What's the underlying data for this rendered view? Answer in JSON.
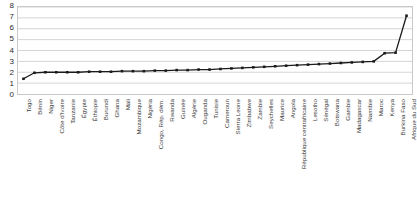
{
  "chart_data": {
    "type": "line",
    "title": "",
    "xlabel": "",
    "ylabel": "",
    "ylim": [
      0,
      8
    ],
    "yticks": [
      0,
      1,
      2,
      3,
      4,
      5,
      6,
      7,
      8
    ],
    "grid": true,
    "legend": false,
    "marker": "square",
    "line_color": "#1a1a1a",
    "grid_color": "#c9c9c9",
    "categories": [
      "Togo",
      "Bénin",
      "Niger",
      "Côte d'Ivoire",
      "Tanzanie",
      "Égypte",
      "Éthiopie",
      "Burundi",
      "Ghana",
      "Mali",
      "Mozambique",
      "Nigéria",
      "Congo, Rép. dém.",
      "Rwanda",
      "Guinée",
      "Algérie",
      "Ouganda",
      "Tunisie",
      "Cameroun",
      "Sierra Leone",
      "Zimbabwe",
      "Zambie",
      "Seychelles",
      "Maurice",
      "Angola",
      "République centrafricaine",
      "Lesotho",
      "Sénégal",
      "Botswana",
      "Gambie",
      "Madagascar",
      "Namibie",
      "Maroc",
      "Kenya",
      "Burkina Faso",
      "Afrique du Sud"
    ],
    "values": [
      1.4,
      1.95,
      2.0,
      2.0,
      2.0,
      2.0,
      2.05,
      2.05,
      2.05,
      2.1,
      2.1,
      2.1,
      2.15,
      2.15,
      2.2,
      2.2,
      2.25,
      2.25,
      2.3,
      2.35,
      2.4,
      2.45,
      2.5,
      2.55,
      2.6,
      2.65,
      2.7,
      2.75,
      2.8,
      2.85,
      2.9,
      2.95,
      3.0,
      3.75,
      3.8,
      7.2
    ]
  }
}
